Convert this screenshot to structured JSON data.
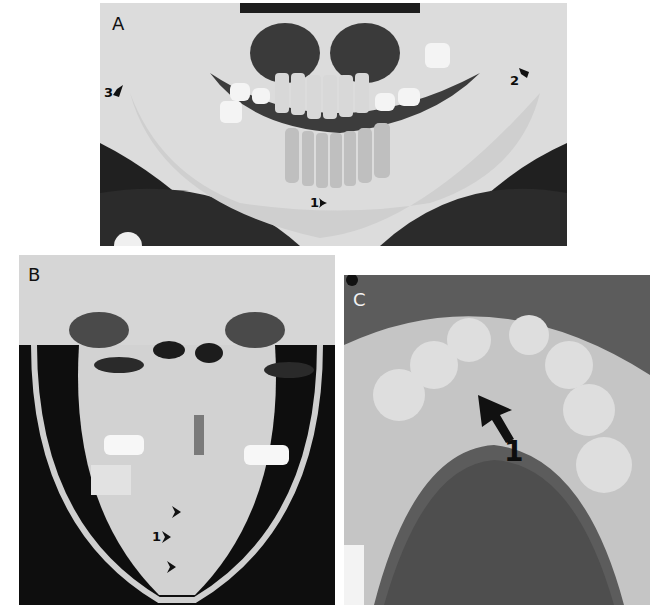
{
  "figure": {
    "panels": [
      {
        "id": "A",
        "label": "A",
        "view": "panoramic-radiograph-mandible",
        "markers": [
          {
            "num": "1",
            "position": "symphysis"
          },
          {
            "num": "2",
            "position": "right-condyle-region"
          },
          {
            "num": "3",
            "position": "left-ramus-region"
          }
        ]
      },
      {
        "id": "B",
        "label": "B",
        "view": "frontal-radiograph-skull",
        "markers": [
          {
            "num": "1",
            "position": "midline-symphysis"
          }
        ]
      },
      {
        "id": "C",
        "label": "C",
        "view": "occlusal-radiograph-mandible",
        "markers": [
          {
            "num": "1",
            "position": "anterior-midline-fracture"
          }
        ]
      }
    ]
  }
}
